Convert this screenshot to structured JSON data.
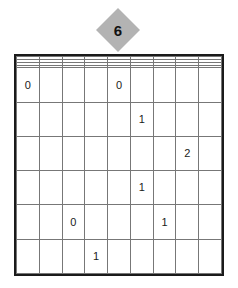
{
  "puzzle": {
    "type": "number-grid-puzzle",
    "grid": {
      "columns": 9,
      "rows": 10,
      "border_color": "#1a1a1a",
      "line_color": "#777777",
      "cell_background": "#ffffff",
      "values": [
        [
          "",
          "",
          "",
          "",
          "",
          "",
          "",
          "",
          ""
        ],
        [
          "",
          "",
          "",
          "",
          "",
          "",
          "",
          "",
          ""
        ],
        [
          "",
          "",
          "",
          "",
          "",
          "",
          "",
          "",
          ""
        ],
        [
          "",
          "",
          "",
          "",
          "",
          "",
          "",
          "",
          ""
        ],
        [
          "0",
          "",
          "",
          "",
          "0",
          "",
          "",
          "",
          ""
        ],
        [
          "",
          "",
          "",
          "",
          "",
          "1",
          "",
          "",
          ""
        ],
        [
          "",
          "",
          "",
          "",
          "",
          "",
          "",
          "2",
          ""
        ],
        [
          "",
          "",
          "",
          "",
          "",
          "1",
          "",
          "",
          ""
        ],
        [
          "",
          "",
          "0",
          "",
          "",
          "",
          "1",
          "",
          ""
        ],
        [
          "",
          "",
          "",
          "1",
          "",
          "",
          "",
          "",
          ""
        ]
      ]
    },
    "markers": [
      {
        "label": "6",
        "shape": "diamond",
        "fill_color": "#b3b3b3",
        "text_color": "#111111",
        "target_column": 5,
        "position_left": 96,
        "position_top": 8
      }
    ]
  }
}
